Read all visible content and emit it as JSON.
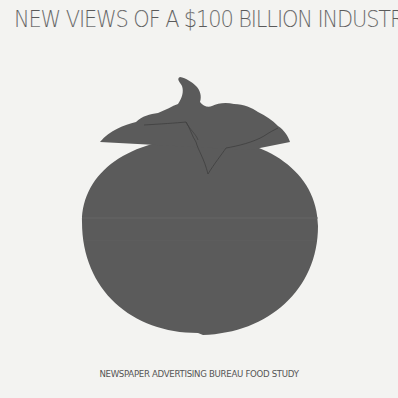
{
  "poster": {
    "title": "NEW VIEWS OF A $100 BILLION INDUSTRY",
    "footer": "NEWSPAPER ADVERTISING BUREAU FOOD STUDY",
    "illustration": {
      "subject": "tomato-silhouette",
      "fill_color": "#5b5b5b",
      "background_color": "#f3f3f1"
    }
  }
}
